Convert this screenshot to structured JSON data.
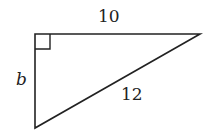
{
  "diagram": {
    "type": "right-triangle",
    "labels": {
      "top_side": "10",
      "left_side": "b",
      "hypotenuse": "12"
    },
    "right_angle_marker": true,
    "colors": {
      "stroke": "#222222",
      "background": "#ffffff"
    }
  }
}
